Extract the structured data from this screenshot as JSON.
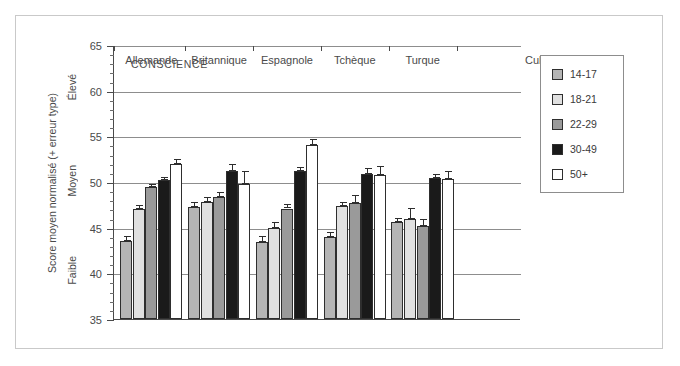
{
  "chart_data": {
    "type": "bar",
    "title": "CONSCIENCE",
    "xlabel": "Culture",
    "ylabel": "Score moyen normalisé (+ erreur type)",
    "ylim": [
      35,
      65
    ],
    "ytick_step": 5,
    "yminor_step": 1,
    "grid": true,
    "legend_position": "right",
    "y_axis_inner_labels": [
      {
        "label": "Élevé",
        "value": 60
      },
      {
        "label": "Moyen",
        "value": 50
      },
      {
        "label": "Faible",
        "value": 40
      }
    ],
    "ytick_labels": [
      "35",
      "40",
      "45",
      "50",
      "55",
      "60",
      "65"
    ],
    "categories": [
      "Allemande",
      "Britannique",
      "Espagnole",
      "Tchèque",
      "Turque"
    ],
    "series": [
      {
        "name": "14-17",
        "color": "#b5b5b5",
        "values": [
          43.5,
          47.3,
          43.4,
          44.0,
          45.6
        ],
        "errors": [
          0.55,
          0.55,
          0.65,
          0.5,
          0.5
        ]
      },
      {
        "name": "18-21",
        "color": "#e0e0e0",
        "values": [
          47.0,
          47.8,
          45.0,
          47.4,
          45.9
        ],
        "errors": [
          0.45,
          0.55,
          0.6,
          0.45,
          1.2
        ]
      },
      {
        "name": "22-29",
        "color": "#9a9a9a",
        "values": [
          49.4,
          48.4,
          47.1,
          47.7,
          45.2
        ],
        "errors": [
          0.4,
          0.5,
          0.5,
          0.85,
          0.7
        ]
      },
      {
        "name": "30-49",
        "color": "#1a1a1a",
        "values": [
          50.2,
          51.2,
          51.2,
          50.9,
          50.4
        ],
        "errors": [
          0.4,
          0.75,
          0.45,
          0.6,
          0.45
        ]
      },
      {
        "name": "50+",
        "color": "#ffffff",
        "values": [
          52.0,
          49.8,
          54.0,
          50.8,
          50.3
        ],
        "errors": [
          0.5,
          1.35,
          0.75,
          0.95,
          0.9
        ]
      }
    ]
  },
  "legend": {
    "items": [
      {
        "label": "14-17",
        "color": "#b5b5b5"
      },
      {
        "label": "18-21",
        "color": "#e0e0e0"
      },
      {
        "label": "22-29",
        "color": "#9a9a9a"
      },
      {
        "label": "30-49",
        "color": "#1a1a1a"
      },
      {
        "label": "50+",
        "color": "#ffffff"
      }
    ]
  }
}
